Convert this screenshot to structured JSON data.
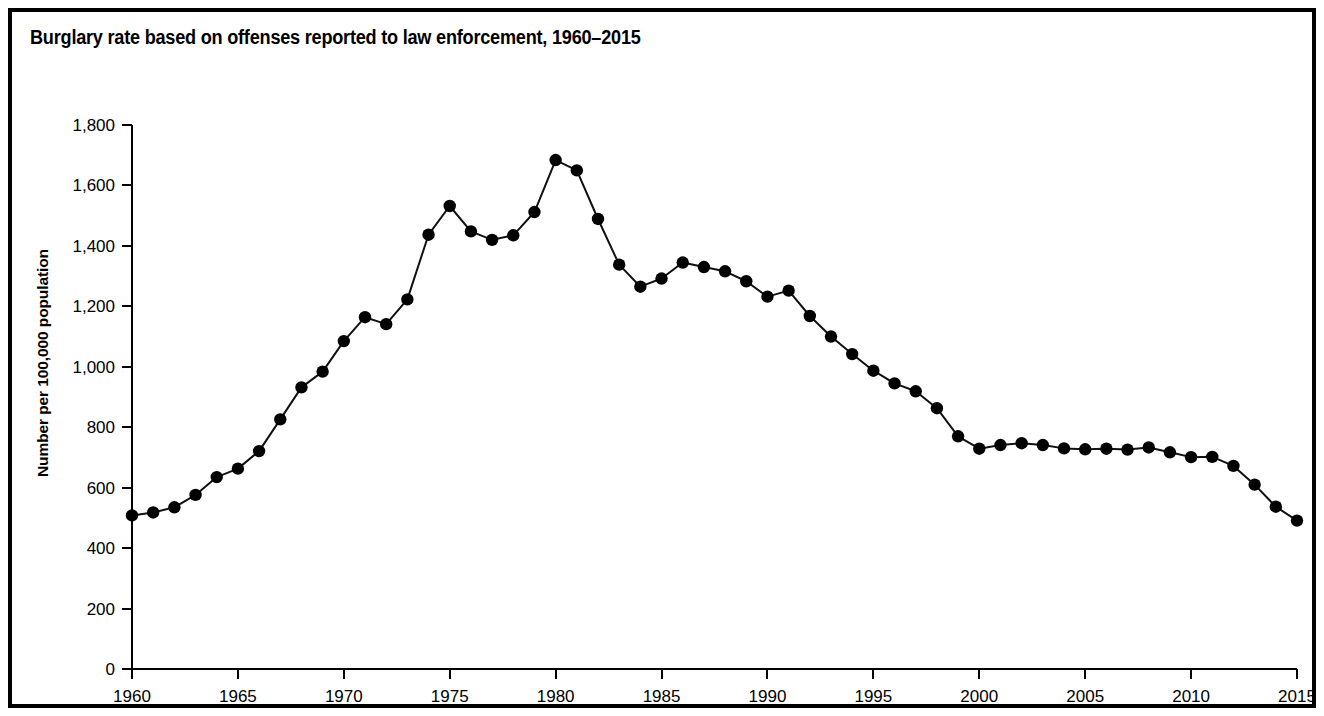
{
  "figure": {
    "title": "Burglary rate based on offenses reported to law enforcement, 1960–2015",
    "border_color": "#000000",
    "background_color": "#ffffff"
  },
  "chart_data": {
    "type": "line",
    "title": "Burglary rate based on offenses reported to law enforcement, 1960–2015",
    "xlabel": "",
    "ylabel": "Number per 100,000 population",
    "xlim": [
      1960,
      2015
    ],
    "ylim": [
      0,
      1800
    ],
    "grid": false,
    "legend": null,
    "marker": "filled-circle",
    "marker_color": "#000000",
    "line_color": "#111111",
    "y_ticks": [
      0,
      200,
      400,
      600,
      800,
      1000,
      1200,
      1400,
      1600,
      1800
    ],
    "y_tick_labels": [
      "0",
      "200",
      "400",
      "600",
      "800",
      "1,000",
      "1,200",
      "1,400",
      "1,600",
      "1,800"
    ],
    "x_ticks": [
      1960,
      1965,
      1970,
      1975,
      1980,
      1985,
      1990,
      1995,
      2000,
      2005,
      2010,
      2015
    ],
    "x_tick_labels": [
      "1960",
      "1965",
      "1970",
      "1975",
      "1980",
      "1985",
      "1990",
      "1995",
      "2000",
      "2005",
      "2010",
      "2015"
    ],
    "x": [
      1960,
      1961,
      1962,
      1963,
      1964,
      1965,
      1966,
      1967,
      1968,
      1969,
      1970,
      1971,
      1972,
      1973,
      1974,
      1975,
      1976,
      1977,
      1978,
      1979,
      1980,
      1981,
      1982,
      1983,
      1984,
      1985,
      1986,
      1987,
      1988,
      1989,
      1990,
      1991,
      1992,
      1993,
      1994,
      1995,
      1996,
      1997,
      1998,
      1999,
      2000,
      2001,
      2002,
      2003,
      2004,
      2005,
      2006,
      2007,
      2008,
      2009,
      2010,
      2011,
      2012,
      2013,
      2014,
      2015
    ],
    "values": [
      508,
      518,
      535,
      576,
      635,
      663,
      721,
      826,
      932,
      984,
      1085,
      1164,
      1141,
      1223,
      1437,
      1532,
      1448,
      1420,
      1435,
      1512,
      1684,
      1650,
      1489,
      1338,
      1265,
      1292,
      1345,
      1330,
      1316,
      1283,
      1232,
      1252,
      1168,
      1100,
      1042,
      987,
      945,
      919,
      863,
      770,
      729,
      741,
      747,
      741,
      730,
      727,
      729,
      726,
      733,
      717,
      701,
      702,
      672,
      610,
      537,
      491
    ],
    "series": [
      {
        "name": "Burglary rate",
        "values": [
          508,
          518,
          535,
          576,
          635,
          663,
          721,
          826,
          932,
          984,
          1085,
          1164,
          1141,
          1223,
          1437,
          1532,
          1448,
          1420,
          1435,
          1512,
          1684,
          1650,
          1489,
          1338,
          1265,
          1292,
          1345,
          1330,
          1316,
          1283,
          1232,
          1252,
          1168,
          1100,
          1042,
          987,
          945,
          919,
          863,
          770,
          729,
          741,
          747,
          741,
          730,
          727,
          729,
          726,
          733,
          717,
          701,
          702,
          672,
          610,
          537,
          491
        ]
      }
    ]
  }
}
